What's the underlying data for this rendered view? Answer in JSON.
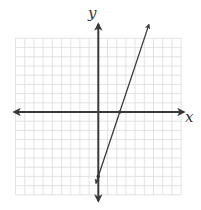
{
  "chart_data": {
    "type": "line",
    "title": "",
    "xlabel": "x",
    "ylabel": "y",
    "grid": true,
    "xlim": [
      -9,
      9
    ],
    "ylim": [
      -9,
      8
    ],
    "tick_labels": "none",
    "series": [
      {
        "name": "line",
        "equation": "y = 3x - 7",
        "slope": 3,
        "intercept": -7,
        "x_intercept": 2.33,
        "y_intercept": -7,
        "x": [
          -0.25,
          5.5
        ],
        "y": [
          -7.75,
          9.5
        ],
        "marked_points": [
          [
            2.33,
            0
          ],
          [
            0,
            -7
          ]
        ]
      }
    ]
  },
  "axes": {
    "x_label": "x",
    "y_label": "y"
  },
  "colors": {
    "grid": "#dcdcdc",
    "axis": "#3a3a3a",
    "line": "#3a3a3a",
    "background": "#ffffff"
  }
}
